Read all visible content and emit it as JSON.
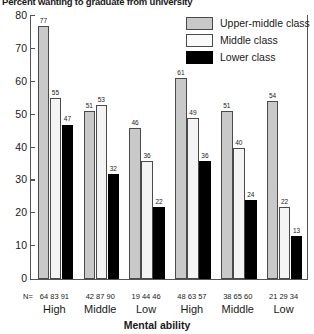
{
  "chart_data": {
    "type": "bar",
    "title": "Percent wanting to graduate from university",
    "xlabel": "Mental ability",
    "ylabel": "",
    "ylim": [
      0,
      80
    ],
    "yticks": [
      0,
      10,
      20,
      30,
      40,
      50,
      60,
      70,
      80
    ],
    "grid": false,
    "legend_position": "top-right",
    "categories": [
      "High",
      "Middle",
      "Low",
      "High",
      "Middle",
      "Low"
    ],
    "series": [
      {
        "name": "Upper-middle class",
        "color": "#c9c9c9",
        "values": [
          77,
          51,
          46,
          61,
          51,
          54
        ]
      },
      {
        "name": "Middle class",
        "color": "#f4f4f4",
        "values": [
          55,
          53,
          36,
          49,
          40,
          22
        ]
      },
      {
        "name": "Lower class",
        "color": "#000000",
        "values": [
          47,
          32,
          22,
          36,
          24,
          13
        ]
      }
    ],
    "n_prefix": "N=",
    "n_values": [
      [
        "64",
        "83",
        "91"
      ],
      [
        "42",
        "87",
        "90"
      ],
      [
        "19",
        "44",
        "46"
      ],
      [
        "48",
        "63",
        "57"
      ],
      [
        "38",
        "65",
        "60"
      ],
      [
        "21",
        "29",
        "34"
      ]
    ]
  },
  "legend": {
    "items": [
      {
        "label": "Upper-middle class"
      },
      {
        "label": "Middle class"
      },
      {
        "label": "Lower class"
      }
    ]
  }
}
